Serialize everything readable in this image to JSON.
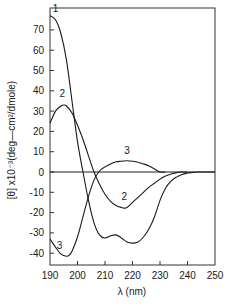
{
  "chart_data": {
    "type": "line",
    "title": "",
    "xlabel": "λ (nm)",
    "ylabel": "[θ] x10⁻³(deg—cm²/dmole)",
    "xlim": [
      190,
      250
    ],
    "ylim": [
      -46,
      81
    ],
    "grid": false,
    "legend_position": "inline curve labels",
    "x_ticks": [
      190,
      200,
      210,
      220,
      230,
      240,
      250
    ],
    "y_ticks": [
      -40,
      -30,
      -20,
      -10,
      0,
      10,
      20,
      30,
      40,
      50,
      60,
      70
    ],
    "zero_line": true,
    "series": [
      {
        "name": "1",
        "label_pos": [
          192,
          79
        ],
        "x": [
          190,
          192,
          194,
          196,
          198,
          200,
          202,
          204,
          206,
          208,
          210,
          212,
          214,
          216,
          218,
          220,
          222,
          224,
          226,
          228,
          230,
          232,
          234,
          236,
          238,
          240,
          242,
          244,
          246,
          248,
          250
        ],
        "values": [
          77,
          75,
          68,
          55,
          35,
          15,
          0,
          -14,
          -25,
          -31,
          -32.5,
          -31.5,
          -31,
          -32.5,
          -34.5,
          -35,
          -34.5,
          -32,
          -28,
          -22,
          -14,
          -8,
          -4.5,
          -2.5,
          -1.2,
          -0.5,
          -0.2,
          0,
          0,
          0,
          0
        ]
      },
      {
        "name": "2",
        "label_pos": [
          194.5,
          37
        ],
        "label2_pos": [
          217,
          -14
        ],
        "x": [
          190,
          192,
          194,
          195,
          196,
          198,
          200,
          202,
          204,
          206,
          208,
          210,
          212,
          214,
          216,
          217,
          218,
          220,
          222,
          224,
          226,
          228,
          230,
          232,
          234,
          236,
          238,
          240
        ],
        "values": [
          24,
          30,
          32.5,
          33,
          32.5,
          29,
          23,
          16,
          8,
          0,
          -6,
          -11,
          -14.5,
          -16.5,
          -17.5,
          -17.8,
          -17.5,
          -15,
          -12.5,
          -10,
          -7.5,
          -5.5,
          -3.5,
          -2,
          -1,
          -0.3,
          0,
          0
        ]
      },
      {
        "name": "3",
        "label_pos": [
          193.5,
          -38
        ],
        "label2_pos": [
          218,
          9
        ],
        "x": [
          190,
          192,
          194,
          196,
          197,
          198,
          200,
          202,
          204,
          206,
          208,
          210,
          212,
          214,
          216,
          218,
          220,
          222,
          224,
          226,
          228,
          230,
          232
        ],
        "values": [
          -33,
          -37,
          -40.5,
          -41.5,
          -41,
          -39,
          -32,
          -22,
          -12,
          -4,
          0.5,
          2.5,
          4,
          5,
          5.3,
          5.5,
          5.3,
          4.8,
          4,
          3,
          1.5,
          0,
          0
        ]
      }
    ]
  },
  "axes": {
    "x_label": "λ (nm)",
    "y_label": "[θ] x10⁻³(deg—cm²/dmole)",
    "x_tick_labels": [
      "190",
      "200",
      "210",
      "220",
      "230",
      "240",
      "250"
    ],
    "y_tick_labels": [
      "70",
      "60",
      "50",
      "40",
      "30",
      "20",
      "10",
      "0",
      "-10",
      "-20",
      "-30",
      "-40"
    ]
  },
  "colors": {
    "line": "#1a1a1a",
    "axis": "#333333",
    "background": "#ffffff"
  }
}
